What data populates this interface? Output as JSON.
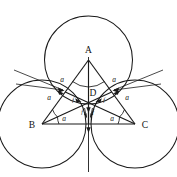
{
  "figure": {
    "background_color": "#ffffff",
    "stroke_color": "#1a1a1a",
    "width": 177,
    "height": 177
  },
  "vertices": [
    {
      "id": "A",
      "label": "A",
      "x": 88.5,
      "y": 60.0,
      "label_x": 88.5,
      "label_y": 52.0
    },
    {
      "id": "B",
      "label": "B",
      "x": 42.0,
      "y": 124.0,
      "label_x": 33.0,
      "label_y": 127.0
    },
    {
      "id": "C",
      "label": "C",
      "x": 135.0,
      "y": 124.0,
      "label_x": 143.0,
      "label_y": 127.0
    },
    {
      "id": "D",
      "label": "D",
      "x": 88.5,
      "y": 102.7,
      "label_x": 93.5,
      "label_y": 100.0
    }
  ],
  "circles": [
    {
      "centre": "A",
      "cx": 88.5,
      "cy": 60.0,
      "r": 44.0
    },
    {
      "centre": "B",
      "cx": 42.0,
      "cy": 124.0,
      "r": 44.0
    },
    {
      "centre": "C",
      "cx": 135.0,
      "cy": 124.0,
      "r": 44.0
    }
  ],
  "triangle_sides": [
    {
      "from": "A",
      "to": "B"
    },
    {
      "from": "B",
      "to": "C"
    },
    {
      "from": "C",
      "to": "A"
    }
  ],
  "side_labels": [
    {
      "text": "a",
      "x": 62.0,
      "y": 82.0,
      "edge": "AB-upper"
    },
    {
      "text": "a",
      "x": 114.0,
      "y": 82.0,
      "edge": "AC-upper"
    },
    {
      "text": "a",
      "x": 50.0,
      "y": 99.0,
      "edge": "AB-lower"
    },
    {
      "text": "a",
      "x": 126.0,
      "y": 99.0,
      "edge": "AC-lower"
    },
    {
      "text": "a",
      "x": 64.0,
      "y": 120.5,
      "edge": "BC-left"
    },
    {
      "text": "a",
      "x": 112.0,
      "y": 120.5,
      "edge": "BC-right"
    }
  ],
  "angle_arcs": [
    {
      "at": "A",
      "side": "left"
    },
    {
      "at": "A",
      "side": "right"
    },
    {
      "at": "B",
      "side": "upper"
    },
    {
      "at": "B",
      "side": "lower"
    },
    {
      "at": "C",
      "side": "upper"
    },
    {
      "at": "C",
      "side": "lower"
    }
  ],
  "force_vectors": [
    {
      "name": "force-from-A",
      "label": "f",
      "direction": "down",
      "from_x": 88.5,
      "from_y": 106.0,
      "to_x": 88.5,
      "to_y": 126.0
    },
    {
      "name": "force-from-B",
      "label": "f",
      "direction": "up-right",
      "from_x": 62.0,
      "from_y": 93.0,
      "to_x": 83.0,
      "to_y": 104.0
    },
    {
      "name": "force-from-C",
      "label": "f",
      "direction": "up-left",
      "from_x": 115.0,
      "from_y": 93.0,
      "to_x": 94.0,
      "to_y": 104.0
    }
  ],
  "force_labels": [
    {
      "text": "f",
      "x": 82.0,
      "y": 113.0
    },
    {
      "text": "f",
      "x": 92.5,
      "y": 113.0
    },
    {
      "text": "f",
      "x": 72.0,
      "y": 101.0
    },
    {
      "text": "f",
      "x": 104.0,
      "y": 101.0
    }
  ],
  "pointer_lines": [
    {
      "name": "left-tangent-pointer",
      "x1": 14.0,
      "y1": 70.0,
      "x2": 63.0,
      "y2": 90.0
    },
    {
      "name": "right-tangent-pointer",
      "x1": 163.0,
      "y1": 70.0,
      "x2": 114.0,
      "y2": 90.0
    }
  ],
  "axis_lines": [
    {
      "name": "vertical-axis",
      "x1": 88.5,
      "y1": 57.0,
      "x2": 88.5,
      "y2": 172.0
    }
  ]
}
